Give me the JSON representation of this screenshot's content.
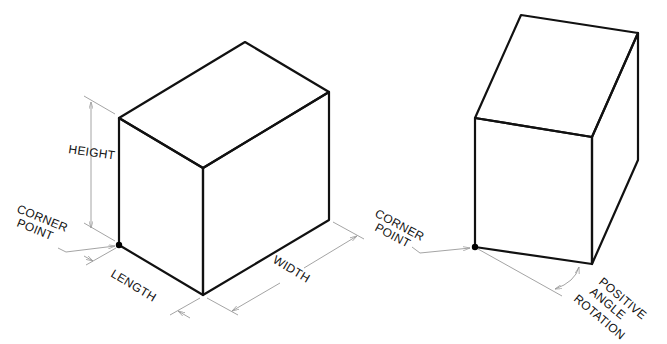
{
  "figure_left": {
    "labels": {
      "height": "HEIGHT",
      "corner_line1": "CORNER",
      "corner_line2": "POINT",
      "length": "LENGTH",
      "width": "WIDTH"
    }
  },
  "figure_right": {
    "labels": {
      "corner_line1": "CORNER",
      "corner_line2": "POINT",
      "rotation_line1": "POSITIVE",
      "rotation_line2": "ANGLE",
      "rotation_line3": "ROTATION"
    }
  },
  "colors": {
    "edge": "#111111",
    "dimension": "#9a9a9a",
    "background": "#ffffff"
  }
}
